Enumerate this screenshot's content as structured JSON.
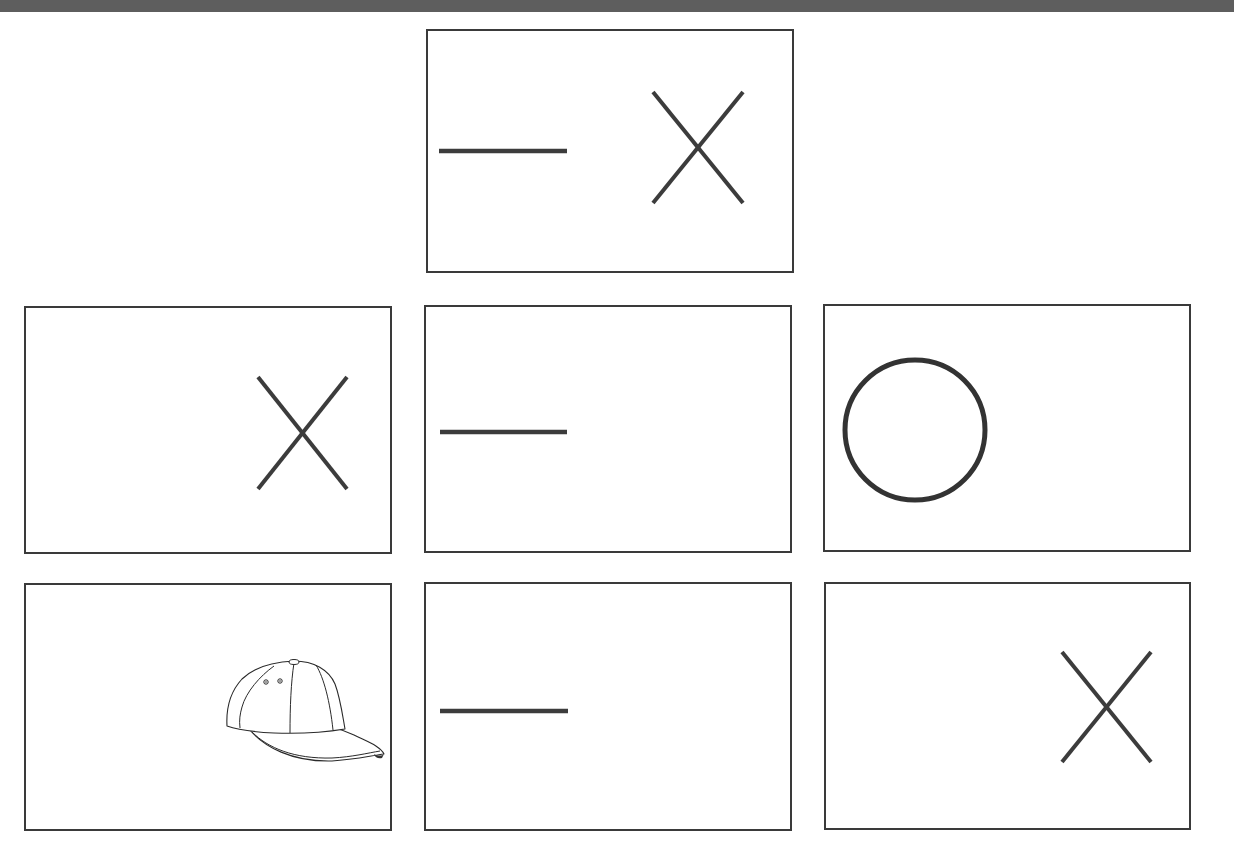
{
  "page": {
    "background": "#ffffff",
    "topbar_color": "#5e5e5e",
    "stroke_color": "#3c3c3c"
  },
  "puzzle": {
    "layout": "one card on top row (center), 3x2 grid below",
    "cards": [
      {
        "id": "top",
        "row": 0,
        "col": 1,
        "symbols": [
          "dash",
          "x"
        ]
      },
      {
        "id": "r1c1",
        "row": 1,
        "col": 0,
        "symbols": [
          "x"
        ]
      },
      {
        "id": "r1c2",
        "row": 1,
        "col": 1,
        "symbols": [
          "dash"
        ]
      },
      {
        "id": "r1c3",
        "row": 1,
        "col": 2,
        "symbols": [
          "circle"
        ]
      },
      {
        "id": "r2c1",
        "row": 2,
        "col": 0,
        "symbols": [
          "baseball-cap"
        ]
      },
      {
        "id": "r2c2",
        "row": 2,
        "col": 1,
        "symbols": [
          "dash"
        ]
      },
      {
        "id": "r2c3",
        "row": 2,
        "col": 2,
        "symbols": [
          "x"
        ]
      }
    ]
  }
}
